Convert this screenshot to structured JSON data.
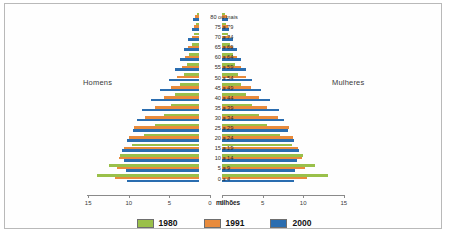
{
  "chart_data": {
    "type": "bar",
    "subtype": "population-pyramid",
    "title": "",
    "xlabel": "milhões",
    "ylabel": "",
    "grid": false,
    "legend_position": "bottom",
    "axis_ticks_left": [
      "15",
      "10",
      "5",
      "0"
    ],
    "axis_ticks_right": [
      "0",
      "5",
      "10",
      "15"
    ],
    "xlim": [
      0,
      15
    ],
    "side_labels": {
      "left": "Homens",
      "right": "Mulheres"
    },
    "categories": [
      "80 ou mais",
      "75 a 79",
      "70 a 74",
      "65 a 69",
      "60 a 64",
      "55 a 59",
      "50 a 54",
      "45 a 49",
      "40 a 44",
      "35 a 39",
      "30 a 34",
      "25 a 29",
      "20 a 24",
      "15 a 19",
      "10 a 14",
      "5 a 9",
      "0 a 4"
    ],
    "series": [
      {
        "name": "1980",
        "color": "#9ac04a",
        "men": [
          0.3,
          0.4,
          0.6,
          0.9,
          1.2,
          1.5,
          1.9,
          2.3,
          2.9,
          3.5,
          4.3,
          5.4,
          6.8,
          8.3,
          9.7,
          11.1,
          12.6
        ],
        "women": [
          0.4,
          0.5,
          0.7,
          1.0,
          1.3,
          1.6,
          2.0,
          2.4,
          3.0,
          3.7,
          4.5,
          5.6,
          7.1,
          8.6,
          10.0,
          11.4,
          13.1
        ]
      },
      {
        "name": "1991",
        "color": "#e88b3c",
        "men": [
          0.5,
          0.6,
          0.9,
          1.3,
          1.7,
          2.1,
          2.7,
          3.4,
          4.3,
          5.4,
          6.7,
          8.0,
          8.6,
          9.2,
          9.8,
          10.1,
          10.3
        ],
        "women": [
          0.6,
          0.7,
          1.0,
          1.4,
          1.8,
          2.3,
          2.9,
          3.6,
          4.5,
          5.6,
          6.9,
          8.2,
          8.8,
          9.4,
          9.9,
          10.2,
          10.5
        ]
      },
      {
        "name": "2000",
        "color": "#2a6db0",
        "men": [
          0.7,
          0.9,
          1.3,
          1.8,
          2.3,
          2.9,
          3.7,
          4.8,
          5.9,
          7.0,
          7.6,
          8.1,
          8.9,
          9.5,
          9.2,
          9.0,
          8.9
        ]
      }
    ],
    "legend": [
      {
        "label": "1980",
        "color": "#9ac04a"
      },
      {
        "label": "1991",
        "color": "#e88b3c"
      },
      {
        "label": "2000",
        "color": "#2a6db0"
      }
    ]
  }
}
